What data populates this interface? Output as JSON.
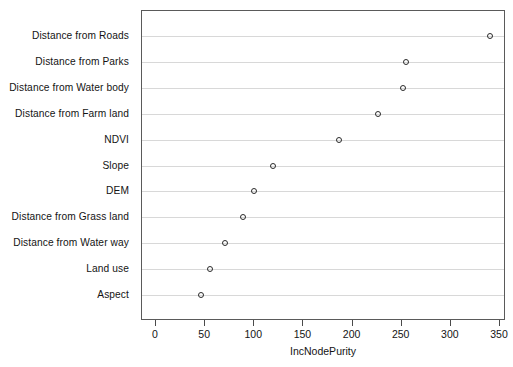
{
  "chart_data": {
    "type": "scatter",
    "subtype": "dotchart",
    "title": "",
    "xlabel": "IncNodePurity",
    "ylabel": "",
    "xlim": [
      0,
      350
    ],
    "ylim": [
      0,
      12
    ],
    "grid": true,
    "grid_axis": "y",
    "legend": null,
    "orientation": "horizontal",
    "marker": "open-circle",
    "xticks": [
      0,
      50,
      100,
      150,
      200,
      250,
      300,
      350
    ],
    "xtick_labels": [
      "0",
      "50",
      "100",
      "150",
      "200",
      "250",
      "300",
      "350"
    ],
    "categories": [
      "Distance from Roads",
      "Distance from Parks",
      "Distance from Water body",
      "Distance from Farm land",
      "NDVI",
      "Slope",
      "DEM",
      "Distance from Grass land",
      "Distance from Water way",
      "Land use",
      "Aspect"
    ],
    "values": [
      340,
      254,
      251,
      226,
      186,
      119,
      100,
      89,
      70,
      55,
      46
    ],
    "points": [
      {
        "category": "Distance from Roads",
        "value": 340
      },
      {
        "category": "Distance from Parks",
        "value": 254
      },
      {
        "category": "Distance from Water body",
        "value": 251
      },
      {
        "category": "Distance from Farm land",
        "value": 226
      },
      {
        "category": "NDVI",
        "value": 186
      },
      {
        "category": "Slope",
        "value": 119
      },
      {
        "category": "DEM",
        "value": 100
      },
      {
        "category": "Distance from Grass land",
        "value": 89
      },
      {
        "category": "Distance from Water way",
        "value": 70
      },
      {
        "category": "Land use",
        "value": 55
      },
      {
        "category": "Aspect",
        "value": 46
      }
    ]
  },
  "style": {
    "point_color": "#2b2b2b",
    "gridline_color": "#d8d8d8",
    "frame_color": "#5a5a5a",
    "background": "#ffffff",
    "text_color": "#141414"
  }
}
